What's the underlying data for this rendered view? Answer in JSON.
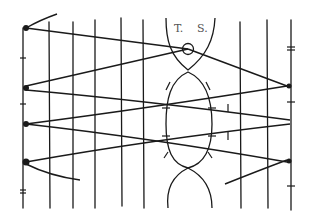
{
  "diagram": {
    "type": "suture-technique-sketch",
    "labels": {
      "t": "T.",
      "s": "S."
    },
    "stroke_color": "#1a1a1a",
    "background": "#ffffff",
    "elements": {
      "vertical_lines": 10,
      "criss_cross_threads": 6,
      "central_oval": "elongated ellipse with tick marks",
      "top_ring": "small circle at convergence point",
      "anchor_points_left": 4,
      "anchor_points_right": 2
    }
  }
}
